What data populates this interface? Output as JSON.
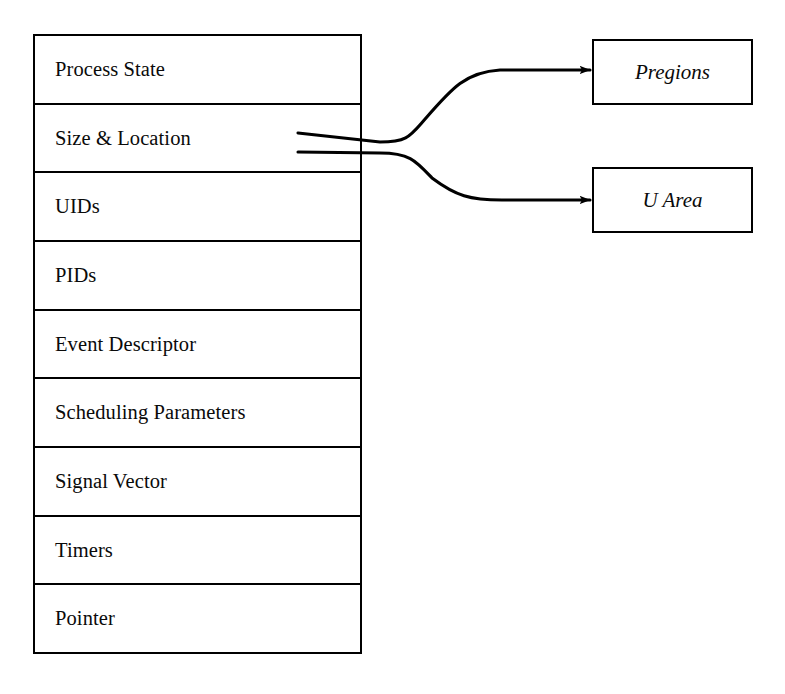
{
  "diagram": {
    "background_color": "#ffffff",
    "line_color": "#000000"
  },
  "process_table": {
    "name": "process-table-entry",
    "rows": [
      {
        "label": "Process State"
      },
      {
        "label": "Size & Location"
      },
      {
        "label": "UIDs"
      },
      {
        "label": "PIDs"
      },
      {
        "label": "Event Descriptor"
      },
      {
        "label": "Scheduling Parameters"
      },
      {
        "label": "Signal Vector"
      },
      {
        "label": "Timers"
      },
      {
        "label": "Pointer"
      }
    ]
  },
  "targets": [
    {
      "label": "Pregions",
      "style": "italic"
    },
    {
      "label": "U Area",
      "style": "italic"
    }
  ],
  "connectors": [
    {
      "name": "size-location-to-pregions",
      "from_row": "Size & Location",
      "to_box": "Pregions",
      "arrowhead": "end"
    },
    {
      "name": "size-location-to-u-area",
      "from_row": "Size & Location",
      "to_box": "U Area",
      "arrowhead": "end"
    }
  ]
}
